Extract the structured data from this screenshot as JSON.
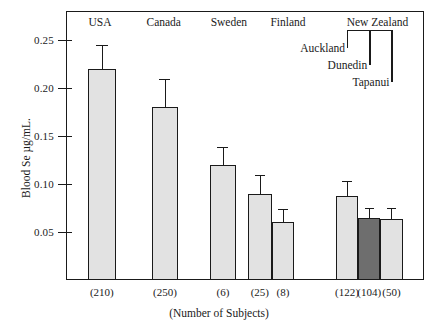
{
  "chart_data": {
    "type": "bar",
    "title": "",
    "xlabel": "(Number of Subjects)",
    "ylabel": "Blood Se µg/mL.",
    "ylim": [
      0.0,
      0.28
    ],
    "yticks": [
      0.05,
      0.1,
      0.15,
      0.2,
      0.25
    ],
    "ytick_labels": [
      "0.05",
      "0.10",
      "0.15",
      "0.20",
      "0.25"
    ],
    "grid": false,
    "legend": "none",
    "group_headers": [
      {
        "label": "USA",
        "center_pct": 9.5
      },
      {
        "label": "Canada",
        "center_pct": 27.3
      },
      {
        "label": "Sweden",
        "center_pct": 45.5
      },
      {
        "label": "Finland",
        "center_pct": 62.0
      },
      {
        "label": "New Zealand",
        "center_pct": 87.0
      }
    ],
    "annotations": [
      {
        "label": "Auckland",
        "target": "Auckland"
      },
      {
        "label": "Dunedin",
        "target": "Dunedin"
      },
      {
        "label": "Tapanui",
        "target": "Tapanui"
      }
    ],
    "categories": [
      "USA",
      "Canada",
      "Sweden",
      "Finland (25)",
      "Finland (8)",
      "Auckland",
      "Dunedin",
      "Tapanui"
    ],
    "values": [
      0.22,
      0.18,
      0.12,
      0.09,
      0.06,
      0.087,
      0.065,
      0.064
    ],
    "errors_upper": [
      0.025,
      0.029,
      0.018,
      0.019,
      0.014,
      0.016,
      0.01,
      0.011
    ],
    "n_labels": [
      "(210)",
      "(250)",
      "(6)",
      "(25)",
      "(8)",
      "(122)",
      "(104)",
      "(50)"
    ],
    "bars": [
      {
        "name": "USA",
        "value": 0.22,
        "err_upper": 0.025,
        "n": "(210)",
        "x_pct": 6.1,
        "width_pct": 7.8,
        "shade": "light"
      },
      {
        "name": "Canada",
        "value": 0.18,
        "err_upper": 0.029,
        "n": "(250)",
        "x_pct": 24.0,
        "width_pct": 7.3,
        "shade": "light"
      },
      {
        "name": "Sweden",
        "value": 0.12,
        "err_upper": 0.018,
        "n": "(6)",
        "x_pct": 40.2,
        "width_pct": 7.3,
        "shade": "light"
      },
      {
        "name": "Finland25",
        "value": 0.09,
        "err_upper": 0.019,
        "n": "(25)",
        "x_pct": 50.8,
        "width_pct": 6.7,
        "shade": "light"
      },
      {
        "name": "Finland8",
        "value": 0.06,
        "err_upper": 0.014,
        "n": "(8)",
        "x_pct": 57.5,
        "width_pct": 6.2,
        "shade": "light"
      },
      {
        "name": "Auckland",
        "value": 0.087,
        "err_upper": 0.016,
        "n": "(122)",
        "x_pct": 75.4,
        "width_pct": 6.2,
        "shade": "light"
      },
      {
        "name": "Dunedin",
        "value": 0.065,
        "err_upper": 0.01,
        "n": "(104)",
        "x_pct": 81.6,
        "width_pct": 6.2,
        "shade": "dark"
      },
      {
        "name": "Tapanui",
        "value": 0.064,
        "err_upper": 0.011,
        "n": "(50)",
        "x_pct": 87.8,
        "width_pct": 6.2,
        "shade": "light"
      }
    ],
    "colors": {
      "bar_light": "#e2e2e2",
      "bar_dark": "#6e6e6e",
      "axis": "#1a1a1a",
      "background": "#ffffff"
    }
  }
}
